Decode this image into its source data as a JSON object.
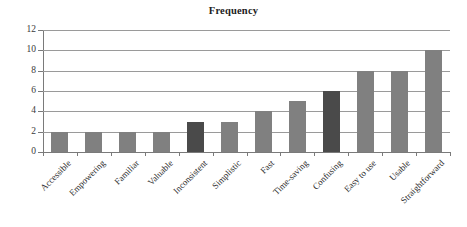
{
  "chart_data": {
    "type": "bar",
    "title": "Frequency",
    "xlabel": "",
    "ylabel": "",
    "ylim": [
      0,
      12
    ],
    "ytick_step": 2,
    "yticks": [
      0,
      2,
      4,
      6,
      8,
      10,
      12
    ],
    "grid": true,
    "legend": false,
    "orientation": "vertical",
    "categories": [
      "Accessible",
      "Empowering",
      "Familiar",
      "Valuable",
      "Inconsistent",
      "Simplistic",
      "Fast",
      "Time-saving",
      "Confusing",
      "Easy to use",
      "Usable",
      "Straightforward"
    ],
    "values": [
      2,
      2,
      2,
      2,
      3,
      3,
      4,
      5,
      6,
      8,
      8,
      10
    ],
    "bar_colors": [
      "#808080",
      "#808080",
      "#808080",
      "#808080",
      "#4a4a4a",
      "#808080",
      "#808080",
      "#808080",
      "#4a4a4a",
      "#808080",
      "#808080",
      "#808080"
    ],
    "colors": {
      "bar_light": "#808080",
      "bar_dark": "#4a4a4a",
      "gridline": "#9a9a9a",
      "axis": "#7a7a7a",
      "text": "#222222",
      "background": "#ffffff"
    }
  }
}
